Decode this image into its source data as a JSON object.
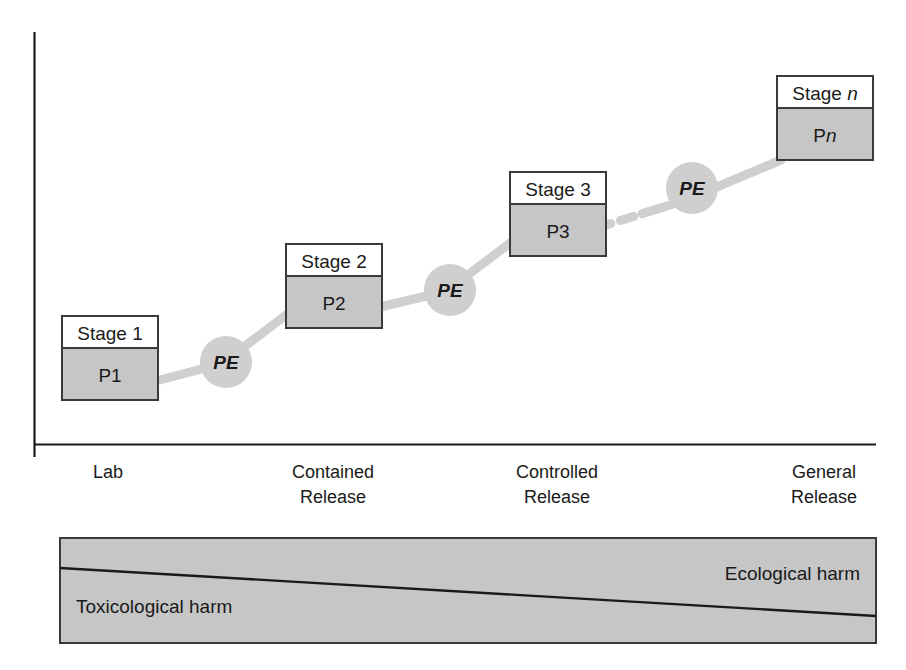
{
  "diagram": {
    "colors": {
      "box_fill": "#c6c6c6",
      "box_header_fill": "#ffffff",
      "box_stroke": "#3a3a3a",
      "connector": "#cfcfcf",
      "axis": "#1a1a1a",
      "text": "#1a1a1a",
      "harm_bar_fill": "#c6c6c6",
      "harm_bar_stroke": "#3a3a3a",
      "harm_divider": "#1a1a1a"
    },
    "stages": [
      {
        "id": "stage-1",
        "title": "Stage 1",
        "body": "P1",
        "body_italic_suffix": ""
      },
      {
        "id": "stage-2",
        "title": "Stage 2",
        "body": "P2",
        "body_italic_suffix": ""
      },
      {
        "id": "stage-3",
        "title": "Stage 3",
        "body": "P3",
        "body_italic_suffix": ""
      },
      {
        "id": "stage-n",
        "title": "Stage ",
        "title_italic_suffix": "n",
        "body": "P",
        "body_italic_suffix": "n"
      }
    ],
    "evaluation_nodes": [
      {
        "id": "pe-1",
        "label": "PE"
      },
      {
        "id": "pe-2",
        "label": "PE"
      },
      {
        "id": "pe-3",
        "label": "PE"
      }
    ],
    "axis": {
      "x_labels": [
        {
          "id": "axis-label-lab",
          "line1": "Lab",
          "line2": ""
        },
        {
          "id": "axis-label-contained-release",
          "line1": "Contained",
          "line2": "Release"
        },
        {
          "id": "axis-label-controlled-release",
          "line1": "Controlled",
          "line2": "Release"
        },
        {
          "id": "axis-label-general-release",
          "line1": "General",
          "line2": "Release"
        }
      ]
    },
    "harm_bar": {
      "left_label": "Toxicological harm",
      "right_label": "Ecological harm"
    }
  }
}
